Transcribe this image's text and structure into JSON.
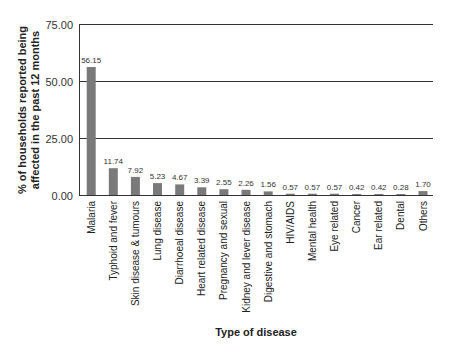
{
  "chart_data": {
    "type": "bar",
    "title": "",
    "xlabel": "Type of disease",
    "ylabel": [
      "% of households reported being",
      "affected in the past 12 months"
    ],
    "ylim": [
      0,
      75
    ],
    "yticks": [
      "0.00",
      "25.00",
      "50.00",
      "75.00"
    ],
    "ytick_values": [
      0,
      25,
      50,
      75
    ],
    "grid": true,
    "legend": null,
    "bar_color": "#7a7a7a",
    "categories": [
      "Malaria",
      "Typhoid and fever",
      "Skin disease & tumours",
      "Lung disease",
      "Diarrhoeal disease",
      "Heart related disease",
      "Pregnancy and sexual",
      "Kidney and lever disease",
      "Digestive and stomach",
      "HIV/AIDS",
      "Mental health",
      "Eye related",
      "Cancer",
      "Ear related",
      "Dental",
      "Others"
    ],
    "values": [
      56.15,
      11.74,
      7.92,
      5.23,
      4.67,
      3.39,
      2.55,
      2.26,
      1.56,
      0.57,
      0.57,
      0.57,
      0.42,
      0.42,
      0.28,
      1.7
    ],
    "value_labels": [
      "56.15",
      "11.74",
      "7.92",
      "5.23",
      "4.67",
      "3.39",
      "2.55",
      "2.26",
      "1.56",
      "0.57",
      "0.57",
      "0.57",
      "0.42",
      "0.42",
      "0.28",
      "1.70"
    ]
  }
}
